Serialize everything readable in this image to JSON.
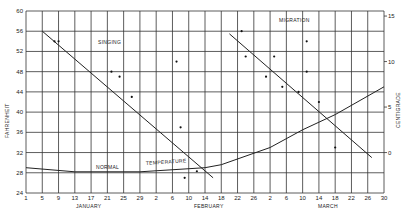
{
  "chart_data": {
    "type": "line",
    "title": "",
    "xlabel": "",
    "ylabel": "FAHRENHEIT",
    "ylabel_right": "CENTIGRADE",
    "ylim": [
      24,
      60
    ],
    "yticks": [
      24,
      28,
      32,
      36,
      40,
      44,
      48,
      52,
      56,
      60
    ],
    "yticks_right": [
      {
        "label": "15",
        "fahrenheit": 59
      },
      {
        "label": "10",
        "fahrenheit": 50
      },
      {
        "label": "5",
        "fahrenheit": 41
      },
      {
        "label": "0",
        "fahrenheit": 32
      }
    ],
    "x_tick_labels": [
      "1",
      "5",
      "9",
      "13",
      "17",
      "21",
      "25",
      "29",
      "2",
      "6",
      "10",
      "14",
      "18",
      "22",
      "26",
      "2",
      "6",
      "10",
      "14",
      "18",
      "22",
      "26",
      "30"
    ],
    "x_tick_days": [
      1,
      5,
      9,
      13,
      17,
      21,
      25,
      29,
      33,
      37,
      41,
      45,
      49,
      53,
      57,
      61,
      65,
      69,
      73,
      77,
      81,
      85,
      89
    ],
    "month_labels": [
      {
        "label": "JANUARY",
        "day": 15
      },
      {
        "label": "FEBRUARY",
        "day": 47
      },
      {
        "label": "MARCH",
        "day": 77
      }
    ],
    "grid": true,
    "annotations": [
      {
        "text": "SINGING",
        "day": 19,
        "fahrenheit": 55
      },
      {
        "text": "MIGRATION",
        "day": 73,
        "fahrenheit": 58.3
      },
      {
        "text": "NORMAL",
        "day": 21,
        "fahrenheit": 28.6
      },
      {
        "text": "TEMPERATURE",
        "day": 35,
        "fahrenheit": 29.3
      }
    ],
    "series": [
      {
        "name": "Singing trend",
        "kind": "line",
        "points": [
          [
            5,
            56
          ],
          [
            47,
            27
          ]
        ]
      },
      {
        "name": "Singing observations",
        "kind": "scatter",
        "points": [
          [
            8,
            54
          ],
          [
            9,
            54
          ],
          [
            22,
            48
          ],
          [
            24,
            47
          ],
          [
            27,
            43
          ],
          [
            38,
            50
          ],
          [
            39,
            37
          ],
          [
            40,
            27
          ],
          [
            43,
            28.3
          ]
        ]
      },
      {
        "name": "Migration trend",
        "kind": "line",
        "points": [
          [
            51,
            55.5
          ],
          [
            86,
            31
          ]
        ]
      },
      {
        "name": "Migration observations",
        "kind": "scatter",
        "points": [
          [
            54,
            56
          ],
          [
            55,
            51
          ],
          [
            60,
            47
          ],
          [
            62,
            51
          ],
          [
            64,
            45
          ],
          [
            68,
            44
          ],
          [
            70,
            54
          ],
          [
            70,
            48
          ],
          [
            73,
            42
          ],
          [
            77,
            33
          ]
        ]
      },
      {
        "name": "Normal temperature",
        "kind": "line",
        "points": [
          [
            1,
            29
          ],
          [
            13,
            28.2
          ],
          [
            29,
            28.2
          ],
          [
            45,
            29
          ],
          [
            49,
            29.6
          ],
          [
            61,
            33
          ],
          [
            69,
            36.5
          ],
          [
            77,
            39.5
          ],
          [
            89,
            45
          ]
        ]
      }
    ]
  },
  "labels": {
    "left_axis": "FAHRENHEIT",
    "right_axis": "CENTIGRADE",
    "singing": "SINGING",
    "migration": "MIGRATION",
    "normal": "NORMAL",
    "temperature": "TEMPERATURE",
    "january": "JANUARY",
    "february": "FEBRUARY",
    "march": "MARCH"
  }
}
